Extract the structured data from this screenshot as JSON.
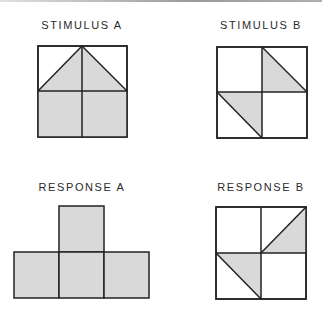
{
  "colors": {
    "fill": "#d9d9d9",
    "stroke": "#222222",
    "background": "#ffffff"
  },
  "panels": [
    {
      "id": "stimulus-a",
      "label": "STIMULUS A",
      "description": "2x2 grid; top row contains a shaded triangle (roof) spanning both top cells with apex at top-center; bottom row both cells fully shaded"
    },
    {
      "id": "stimulus-b",
      "label": "STIMULUS B",
      "description": "2x2 grid; upper-right cell shaded lower-left triangle; lower-left cell shaded upper-right triangle"
    },
    {
      "id": "response-a",
      "label": "RESPONSE A",
      "description": "T-shaped arrangement of four fully shaded squares: one on top center, three in bottom row"
    },
    {
      "id": "response-b",
      "label": "RESPONSE B",
      "description": "2x2 grid; upper-right cell shaded lower-right triangle; lower-left cell shaded upper-right triangle"
    }
  ]
}
